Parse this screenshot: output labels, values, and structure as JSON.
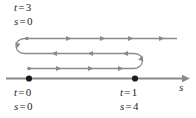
{
  "figure": {
    "axis": {
      "variable_label": "s",
      "direction": "rightward",
      "arrow": "right-arrowhead"
    },
    "colors": {
      "line": "#8a8a8a",
      "axis": "#8a8a8a",
      "dot": "#1a1a1a",
      "text": "#231f20",
      "background": "#ffffff"
    },
    "labels": {
      "top": {
        "t": {
          "var": "t",
          "eq": "=",
          "num": "3"
        },
        "s": {
          "var": "s",
          "eq": "=",
          "num": "0"
        }
      },
      "bottom_left": {
        "t": {
          "var": "t",
          "eq": "=",
          "num": "0"
        },
        "s": {
          "var": "s",
          "eq": "=",
          "num": "0"
        }
      },
      "bottom_right": {
        "t": {
          "var": "t",
          "eq": "=",
          "num": "1"
        },
        "s": {
          "var": "s",
          "eq": "=",
          "num": "4"
        }
      }
    },
    "points": [
      {
        "name": "start-point",
        "t": "0",
        "s": "0"
      },
      {
        "name": "turning-point",
        "t": "1",
        "s": "4"
      }
    ],
    "path_segments": [
      {
        "name": "bottom-segment",
        "direction": "right",
        "arrow_count": 3
      },
      {
        "name": "right-uturn",
        "direction": "up-and-left",
        "arrow_count": 1
      },
      {
        "name": "middle-segment",
        "direction": "left",
        "arrow_count": 3
      },
      {
        "name": "left-uturn",
        "direction": "up-and-right",
        "arrow_count": 1
      },
      {
        "name": "top-segment",
        "direction": "right",
        "arrow_count": 4
      }
    ]
  }
}
